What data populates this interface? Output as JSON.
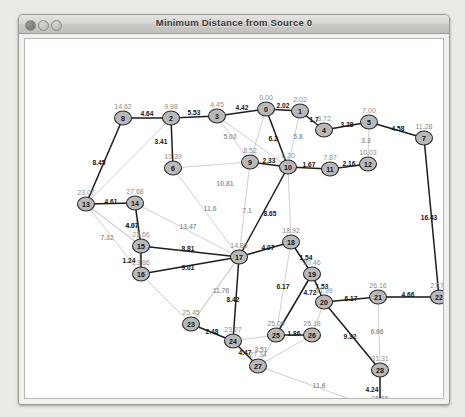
{
  "window": {
    "title": "Minimum Distance from Source 0",
    "controls": [
      {
        "name": "close",
        "label": "close"
      },
      {
        "name": "minimize",
        "label": "minimize"
      },
      {
        "name": "zoom",
        "label": "zoom"
      }
    ]
  },
  "chart_data": {
    "type": "scatter",
    "title": "Minimum Distance from Source 0",
    "source_node": "0",
    "xlabel": "",
    "ylabel": "",
    "nodes": [
      {
        "id": "0",
        "dist": "0.00",
        "x": 241,
        "y": 70,
        "label_dx": 0,
        "label_dy": -9
      },
      {
        "id": "1",
        "dist": "2.02",
        "x": 275,
        "y": 72,
        "label_dx": 0,
        "label_dy": -9
      },
      {
        "id": "2",
        "dist": "9.98",
        "x": 146,
        "y": 79,
        "label_dx": 0,
        "label_dy": -9
      },
      {
        "id": "3",
        "dist": "4.45",
        "x": 192,
        "y": 77,
        "label_dx": 0,
        "label_dy": -9
      },
      {
        "id": "4",
        "dist": "3.72",
        "x": 299,
        "y": 91,
        "label_dx": 0,
        "label_dy": -9
      },
      {
        "id": "5",
        "dist": "7.00",
        "x": 344,
        "y": 83,
        "label_dx": 0,
        "label_dy": -9
      },
      {
        "id": "6",
        "dist": "13.39",
        "x": 148,
        "y": 129,
        "label_dx": 0,
        "label_dy": -9
      },
      {
        "id": "7",
        "dist": "11.28",
        "x": 399,
        "y": 99,
        "label_dx": 0,
        "label_dy": -9
      },
      {
        "id": "8",
        "dist": "14.62",
        "x": 98,
        "y": 79,
        "label_dx": 0,
        "label_dy": -9
      },
      {
        "id": "9",
        "dist": "8.52",
        "x": 225,
        "y": 123,
        "label_dx": 0,
        "label_dy": -9
      },
      {
        "id": "10",
        "dist": "6.20",
        "x": 263,
        "y": 128,
        "label_dx": 0,
        "label_dy": -9
      },
      {
        "id": "11",
        "dist": "7.87",
        "x": 305,
        "y": 130,
        "label_dx": 0,
        "label_dy": -9
      },
      {
        "id": "12",
        "dist": "10.03",
        "x": 343,
        "y": 125,
        "label_dx": 0,
        "label_dy": -9
      },
      {
        "id": "13",
        "dist": "23.07",
        "x": 61,
        "y": 165,
        "label_dx": 0,
        "label_dy": -9
      },
      {
        "id": "14",
        "dist": "27.68",
        "x": 110,
        "y": 164,
        "label_dx": 0,
        "label_dy": -9
      },
      {
        "id": "15",
        "dist": "23.66",
        "x": 116,
        "y": 207,
        "label_dx": 0,
        "label_dy": -9
      },
      {
        "id": "16",
        "dist": "23.86",
        "x": 116,
        "y": 235,
        "label_dx": 0,
        "label_dy": -9
      },
      {
        "id": "17",
        "dist": "14.85",
        "x": 214,
        "y": 218,
        "label_dx": 0,
        "label_dy": -9
      },
      {
        "id": "18",
        "dist": "18.92",
        "x": 266,
        "y": 203,
        "label_dx": 0,
        "label_dy": -9
      },
      {
        "id": "19",
        "dist": "20.46",
        "x": 287,
        "y": 235,
        "label_dx": 0,
        "label_dy": -9
      },
      {
        "id": "20",
        "dist": "21.99",
        "x": 299,
        "y": 263,
        "label_dx": 0,
        "label_dy": -9
      },
      {
        "id": "21",
        "dist": "26.16",
        "x": 353,
        "y": 258,
        "label_dx": 0,
        "label_dy": -9
      },
      {
        "id": "22",
        "dist": "27.71",
        "x": 414,
        "y": 258,
        "label_dx": 0,
        "label_dy": -9
      },
      {
        "id": "23",
        "dist": "25.45",
        "x": 166,
        "y": 285,
        "label_dx": 0,
        "label_dy": -9
      },
      {
        "id": "24",
        "dist": "23.27",
        "x": 208,
        "y": 302,
        "label_dx": 0,
        "label_dy": -9
      },
      {
        "id": "25",
        "dist": "25.09",
        "x": 251,
        "y": 296,
        "label_dx": 0,
        "label_dy": -9
      },
      {
        "id": "26",
        "dist": "25.18",
        "x": 287,
        "y": 296,
        "label_dx": 0,
        "label_dy": -9
      },
      {
        "id": "27",
        "dist": "27.34",
        "x": 233,
        "y": 327,
        "label_dx": 0,
        "label_dy": -9
      },
      {
        "id": "28",
        "dist": "31.31",
        "x": 355,
        "y": 331,
        "label_dx": 0,
        "label_dy": -9
      },
      {
        "id": "29",
        "dist": "35.55",
        "x": 355,
        "y": 371,
        "label_dx": 0,
        "label_dy": -9
      }
    ],
    "tree_edges": [
      {
        "from": "8",
        "to": "2",
        "weight": "4.64",
        "label_x": 122,
        "label_y": 77
      },
      {
        "from": "2",
        "to": "3",
        "weight": "5.53",
        "label_x": 169,
        "label_y": 76
      },
      {
        "from": "2",
        "to": "6",
        "weight": "3.41",
        "label_x": 136,
        "label_y": 105
      },
      {
        "from": "3",
        "to": "0",
        "weight": "4.42",
        "label_x": 217,
        "label_y": 71
      },
      {
        "from": "0",
        "to": "1",
        "weight": "2.02",
        "label_x": 258,
        "label_y": 69
      },
      {
        "from": "1",
        "to": "4",
        "weight": "1.7",
        "label_x": 289,
        "label_y": 83
      },
      {
        "from": "4",
        "to": "5",
        "weight": "3.28",
        "label_x": 322,
        "label_y": 88
      },
      {
        "from": "5",
        "to": "7",
        "weight": "4.58",
        "label_x": 373,
        "label_y": 92
      },
      {
        "from": "0",
        "to": "10",
        "weight": "6.2",
        "label_x": 248,
        "label_y": 102
      },
      {
        "from": "9",
        "to": "10",
        "weight": "2.33",
        "label_x": 244,
        "label_y": 124
      },
      {
        "from": "10",
        "to": "11",
        "weight": "1.67",
        "label_x": 284,
        "label_y": 128
      },
      {
        "from": "11",
        "to": "12",
        "weight": "2.16",
        "label_x": 324,
        "label_y": 127
      },
      {
        "from": "10",
        "to": "17",
        "weight": "8.65",
        "label_x": 245,
        "label_y": 177
      },
      {
        "from": "17",
        "to": "18",
        "weight": "4.07",
        "label_x": 243,
        "label_y": 211
      },
      {
        "from": "18",
        "to": "19",
        "weight": "1.54",
        "label_x": 281,
        "label_y": 221
      },
      {
        "from": "19",
        "to": "20",
        "weight": "1.53",
        "label_x": 297,
        "label_y": 250
      },
      {
        "from": "20",
        "to": "21",
        "weight": "6.17",
        "label_x": 326,
        "label_y": 262
      },
      {
        "from": "20",
        "to": "28",
        "weight": "9.32",
        "label_x": 325,
        "label_y": 300
      },
      {
        "from": "28",
        "to": "29",
        "weight": "4.24",
        "label_x": 347,
        "label_y": 353
      },
      {
        "from": "15",
        "to": "17",
        "weight": "8.81",
        "label_x": 163,
        "label_y": 212
      },
      {
        "from": "16",
        "to": "17",
        "weight": "9.01",
        "label_x": 163,
        "label_y": 231
      },
      {
        "from": "15",
        "to": "16",
        "weight": "1.24",
        "label_x": 104,
        "label_y": 224
      },
      {
        "from": "14",
        "to": "15",
        "weight": "4.07",
        "label_x": 107,
        "label_y": 189
      },
      {
        "from": "13",
        "to": "14",
        "weight": "4.61",
        "label_x": 86,
        "label_y": 165
      },
      {
        "from": "13",
        "to": "8",
        "weight": "8.45",
        "label_x": 74,
        "label_y": 126
      },
      {
        "from": "17",
        "to": "24",
        "weight": "8.42",
        "label_x": 208,
        "label_y": 263
      },
      {
        "from": "23",
        "to": "24",
        "weight": "2.48",
        "label_x": 187,
        "label_y": 295
      },
      {
        "from": "24",
        "to": "27",
        "weight": "4.47",
        "label_x": 220,
        "label_y": 316
      },
      {
        "from": "25",
        "to": "26",
        "weight": "1.86",
        "label_x": 269,
        "label_y": 297
      },
      {
        "from": "19",
        "to": "25",
        "weight": "6.17",
        "label_x": 258,
        "label_y": 250
      },
      {
        "from": "19",
        "to": "20b",
        "weight": "4.72",
        "label_x": 285,
        "label_y": 256
      },
      {
        "from": "21",
        "to": "22",
        "weight": "4.66",
        "label_x": 383,
        "label_y": 258
      },
      {
        "from": "7",
        "to": "22",
        "weight": "16.43",
        "label_x": 404,
        "label_y": 181
      }
    ],
    "nontree_edges": [
      {
        "weight": "5.02",
        "label_x": 205,
        "label_y": 100
      },
      {
        "weight": "10.81",
        "label_x": 200,
        "label_y": 147
      },
      {
        "weight": "7.1",
        "label_x": 222,
        "label_y": 174
      },
      {
        "weight": "11.6",
        "label_x": 185,
        "label_y": 172
      },
      {
        "weight": "3.3",
        "label_x": 341,
        "label_y": 104
      },
      {
        "weight": "5.8",
        "label_x": 273,
        "label_y": 100
      },
      {
        "weight": "7.32",
        "label_x": 82,
        "label_y": 201
      },
      {
        "weight": "13.47",
        "label_x": 163,
        "label_y": 190
      },
      {
        "weight": "4.07",
        "label_x": 107,
        "label_y": 189
      },
      {
        "weight": "6.66",
        "label_x": 352,
        "label_y": 295
      },
      {
        "weight": "11.76",
        "label_x": 196,
        "label_y": 254
      },
      {
        "weight": "3.51",
        "label_x": 236,
        "label_y": 313
      },
      {
        "weight": "11.6",
        "label_x": 294,
        "label_y": 349
      }
    ]
  }
}
